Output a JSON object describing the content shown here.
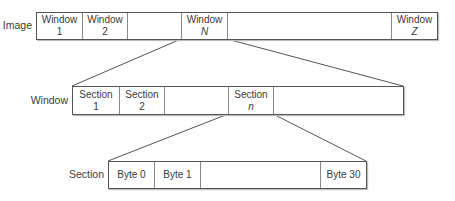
{
  "diagram": {
    "levels": [
      {
        "label": "Image",
        "cells": [
          {
            "line1": "Window",
            "line2": "1",
            "italic": false
          },
          {
            "line1": "Window",
            "line2": "2",
            "italic": false
          },
          {
            "line1": "",
            "line2": "",
            "italic": false
          },
          {
            "line1": "Window",
            "line2": "N",
            "italic": true
          },
          {
            "line1": "",
            "line2": "",
            "italic": false
          },
          {
            "line1": "Window",
            "line2": "Z",
            "italic": true
          }
        ]
      },
      {
        "label": "Window",
        "cells": [
          {
            "line1": "Section",
            "line2": "1",
            "italic": false
          },
          {
            "line1": "Section",
            "line2": "2",
            "italic": false
          },
          {
            "line1": "",
            "line2": "",
            "italic": false
          },
          {
            "line1": "Section",
            "line2": "n",
            "italic": true
          },
          {
            "line1": "",
            "line2": "",
            "italic": false
          }
        ]
      },
      {
        "label": "Section",
        "cells": [
          {
            "line1": "Byte 0",
            "line2": "",
            "italic": false
          },
          {
            "line1": "Byte 1",
            "line2": "",
            "italic": false
          },
          {
            "line1": "",
            "line2": "",
            "italic": false
          },
          {
            "line1": "Byte 30",
            "line2": "",
            "italic": false
          }
        ]
      }
    ],
    "colors": {
      "border": "#555555",
      "divider": "#8a8a8a",
      "text": "#3a3a3a",
      "connector": "#555555"
    }
  }
}
